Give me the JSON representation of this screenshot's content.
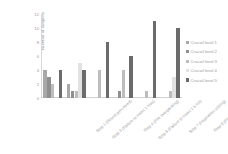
{
  "chart_data": {
    "type": "bar",
    "title": "",
    "xlabel": "",
    "ylabel": "Number of subjects",
    "ylim": [
      0,
      12
    ],
    "yticks": [
      12,
      10,
      8,
      6,
      4,
      2,
      0
    ],
    "grid": false,
    "legend_position": "right",
    "categories": [
      "Step 1 (Sound perceived)",
      "Step 3 (Failure to insert 1 Nos)",
      "Step 4 (File overpacking)",
      "Step 6 (Failure to insert 1 k No)",
      "Step 7 (Inspiration setting)",
      "Step 8 (File overworking)"
    ],
    "series": [
      {
        "name": "Crucial level 1",
        "color": "#a8a8a8",
        "values": [
          4,
          2,
          0,
          0,
          0,
          0
        ]
      },
      {
        "name": "Crucial level 2",
        "color": "#8f8f8f",
        "values": [
          3,
          1,
          0,
          1,
          0,
          0
        ]
      },
      {
        "name": "Crucial level 3",
        "color": "#bdbdbd",
        "values": [
          2,
          1,
          4,
          4,
          1,
          1
        ]
      },
      {
        "name": "Crucial level 4",
        "color": "#e2e2e2",
        "values": [
          0,
          5,
          0,
          0,
          0,
          3
        ]
      },
      {
        "name": "Crucial level 5",
        "color": "#6b6b6b",
        "values": [
          4,
          4,
          8,
          6,
          11,
          10
        ]
      }
    ]
  }
}
